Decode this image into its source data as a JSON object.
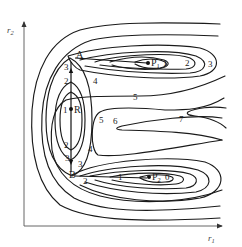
{
  "diagram": {
    "type": "contour_map",
    "axes": {
      "x_label": "r",
      "x_subscript": "1",
      "y_label": "r",
      "y_subscript": "2"
    },
    "points": {
      "R": "R",
      "P1": "P",
      "P1_sub": "1",
      "P2": "P",
      "P2_sub": "2",
      "A": "A",
      "B": "B"
    },
    "contour_labels": {
      "p1_1": "1",
      "p1_2": "2",
      "p1_3": "3",
      "p2_0": "0",
      "p2_1": "1",
      "p2_2": "2",
      "r_1": "1",
      "r_2_top": "2",
      "r_2_bot": "2",
      "r_3_top": "3",
      "r_3_bot": "3",
      "near_b_2": "2",
      "near_b_3": "3",
      "four_top": "4",
      "four_bot": "4",
      "five_left": "5",
      "five_mid": "5",
      "six": "6",
      "seven": "7",
      "p1_inner": "1"
    },
    "colors": {
      "line": "#1a1a1a",
      "axis": "#555555",
      "background": "#ffffff"
    }
  }
}
